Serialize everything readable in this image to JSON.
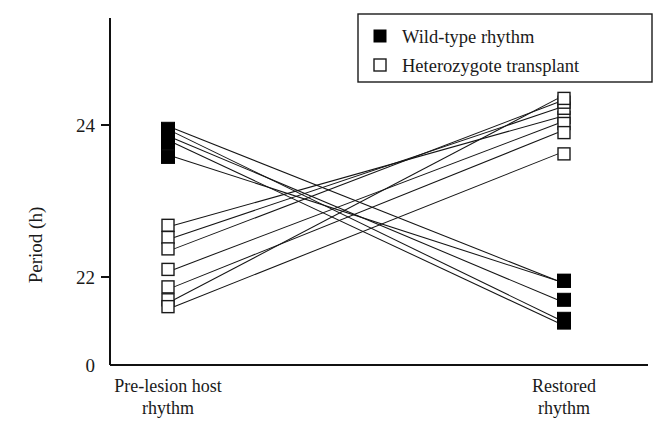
{
  "chart_data": {
    "type": "line",
    "title": "",
    "subtitle": "",
    "xlabel": "",
    "ylabel": "Period (h)",
    "categories": [
      "Pre-lesion host rhythm",
      "Restored rhythm"
    ],
    "category_lines": [
      [
        "Pre-lesion host",
        "rhythm"
      ],
      [
        "Restored",
        "rhythm"
      ]
    ],
    "ytick_labels": [
      "0",
      "22",
      "24"
    ],
    "ytick_values": [
      0,
      22,
      24
    ],
    "ylim": [
      21.3,
      24.6
    ],
    "axis_break": true,
    "grid": false,
    "legend_position": "top-right",
    "legend": [
      {
        "label": "Wild-type rhythm",
        "marker": "filled-square",
        "color": "#000000"
      },
      {
        "label": "Heterozygote transplant",
        "marker": "open-square",
        "color": "#ffffff"
      }
    ],
    "series": [
      {
        "name": "Wild-type rhythm",
        "marker": "filled-square",
        "pairs": [
          {
            "pre": 23.95,
            "post": 21.95
          },
          {
            "pre": 23.9,
            "post": 21.45
          },
          {
            "pre": 23.82,
            "post": 21.7
          },
          {
            "pre": 23.76,
            "post": 21.4
          },
          {
            "pre": 23.58,
            "post": 21.95
          }
        ]
      },
      {
        "name": "Heterozygote transplant",
        "marker": "open-square",
        "pairs": [
          {
            "pre": 22.68,
            "post": 24.1
          },
          {
            "pre": 22.52,
            "post": 24.22
          },
          {
            "pre": 22.37,
            "post": 24.3
          },
          {
            "pre": 22.1,
            "post": 24.02
          },
          {
            "pre": 21.87,
            "post": 23.9
          },
          {
            "pre": 21.7,
            "post": 24.35
          },
          {
            "pre": 21.61,
            "post": 23.62
          }
        ]
      }
    ],
    "counts": {
      "wild_type_pairs": 5,
      "heterozygote_pairs": 7
    }
  }
}
